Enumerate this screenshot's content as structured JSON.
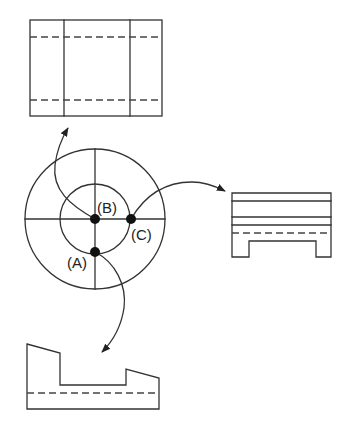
{
  "diagram": {
    "type": "orthographic-projection-views",
    "colors": {
      "line": "#333333",
      "dot": "#111111",
      "background": "#ffffff"
    },
    "labels": {
      "A": "(A)",
      "B": "(B)",
      "C": "(C)"
    },
    "views": [
      {
        "id": "top-view",
        "description": "Rectangle with two inner vertical lines and two dashed hidden lines"
      },
      {
        "id": "right-view",
        "description": "Rectangle with horizontal lines, dashed hidden line, and bottom notch"
      },
      {
        "id": "front-view",
        "description": "Profile with slanted tops, center slot, and dashed hidden line"
      }
    ],
    "viewpoints": [
      {
        "id": "A",
        "arrow_to": "front-view"
      },
      {
        "id": "B",
        "arrow_to": "top-view"
      },
      {
        "id": "C",
        "arrow_to": "right-view"
      }
    ]
  }
}
